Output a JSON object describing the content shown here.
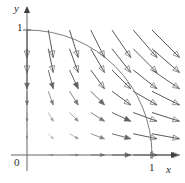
{
  "figure": {
    "kind": "vector-field-plot",
    "background_color": "#ffffff",
    "ink_color": "#4a4a4a",
    "axis_color": "#555555",
    "arc_color": "#666666",
    "label_color": "#2b2b2b"
  },
  "axes": {
    "x_axis_label": "x",
    "y_axis_label": "y",
    "origin_label": "0",
    "x_tick_label": "1",
    "y_tick_label": "1",
    "x_range": [
      0,
      1.15
    ],
    "y_range": [
      0,
      1.15
    ],
    "origin_px": [
      27,
      155
    ],
    "unit_px": 125,
    "x_arrow_tip_px": [
      178,
      155
    ],
    "y_arrow_tip_px": [
      27,
      6
    ]
  },
  "arc": {
    "name": "unit-quarter-circle",
    "radius": 1,
    "center": [
      0,
      0
    ],
    "start": [
      0,
      1
    ],
    "end": [
      1,
      0
    ],
    "quadrant": "first"
  },
  "chart_data": {
    "type": "scatter",
    "title": "",
    "xlabel": "x",
    "ylabel": "y",
    "xlim": [
      0,
      1.15
    ],
    "ylim": [
      0,
      1.15
    ],
    "grid": false,
    "legend": null,
    "field_rule": "arrows point radially outward from origin; length grows with distance from origin",
    "vectors": [
      {
        "x": 0.0,
        "y": 0.0,
        "u": 0.0,
        "v": 0.0
      },
      {
        "x": 0.17,
        "y": 0.0,
        "u": 0.04,
        "v": 0.0
      },
      {
        "x": 0.34,
        "y": 0.0,
        "u": 0.07,
        "v": 0.0
      },
      {
        "x": 0.51,
        "y": 0.0,
        "u": 0.11,
        "v": 0.0
      },
      {
        "x": 0.68,
        "y": 0.0,
        "u": 0.15,
        "v": 0.0
      },
      {
        "x": 0.85,
        "y": 0.0,
        "u": 0.19,
        "v": 0.0
      },
      {
        "x": 1.0,
        "y": 0.0,
        "u": 0.22,
        "v": 0.0
      },
      {
        "x": 0.0,
        "y": 0.17,
        "u": 0.0,
        "v": -0.04
      },
      {
        "x": 0.17,
        "y": 0.17,
        "u": 0.04,
        "v": -0.04
      },
      {
        "x": 0.34,
        "y": 0.17,
        "u": 0.07,
        "v": -0.04
      },
      {
        "x": 0.51,
        "y": 0.17,
        "u": 0.11,
        "v": -0.04
      },
      {
        "x": 0.68,
        "y": 0.17,
        "u": 0.15,
        "v": -0.04
      },
      {
        "x": 0.85,
        "y": 0.17,
        "u": 0.19,
        "v": -0.04
      },
      {
        "x": 1.0,
        "y": 0.17,
        "u": 0.22,
        "v": -0.04
      },
      {
        "x": 0.0,
        "y": 0.34,
        "u": 0.0,
        "v": -0.07
      },
      {
        "x": 0.17,
        "y": 0.34,
        "u": 0.04,
        "v": -0.07
      },
      {
        "x": 0.34,
        "y": 0.34,
        "u": 0.07,
        "v": -0.07
      },
      {
        "x": 0.51,
        "y": 0.34,
        "u": 0.11,
        "v": -0.07
      },
      {
        "x": 0.68,
        "y": 0.34,
        "u": 0.15,
        "v": -0.07
      },
      {
        "x": 0.85,
        "y": 0.34,
        "u": 0.19,
        "v": -0.07
      },
      {
        "x": 1.0,
        "y": 0.34,
        "u": 0.22,
        "v": -0.07
      },
      {
        "x": 0.0,
        "y": 0.51,
        "u": 0.0,
        "v": -0.11
      },
      {
        "x": 0.17,
        "y": 0.51,
        "u": 0.04,
        "v": -0.11
      },
      {
        "x": 0.34,
        "y": 0.51,
        "u": 0.07,
        "v": -0.11
      },
      {
        "x": 0.51,
        "y": 0.51,
        "u": 0.11,
        "v": -0.11
      },
      {
        "x": 0.68,
        "y": 0.51,
        "u": 0.15,
        "v": -0.11
      },
      {
        "x": 0.85,
        "y": 0.51,
        "u": 0.19,
        "v": -0.11
      },
      {
        "x": 1.0,
        "y": 0.51,
        "u": 0.22,
        "v": -0.11
      },
      {
        "x": 0.0,
        "y": 0.68,
        "u": 0.0,
        "v": -0.15
      },
      {
        "x": 0.17,
        "y": 0.68,
        "u": 0.04,
        "v": -0.15
      },
      {
        "x": 0.34,
        "y": 0.68,
        "u": 0.07,
        "v": -0.15
      },
      {
        "x": 0.51,
        "y": 0.68,
        "u": 0.11,
        "v": -0.15
      },
      {
        "x": 0.68,
        "y": 0.68,
        "u": 0.15,
        "v": -0.15
      },
      {
        "x": 0.85,
        "y": 0.68,
        "u": 0.19,
        "v": -0.15
      },
      {
        "x": 1.0,
        "y": 0.68,
        "u": 0.22,
        "v": -0.15
      },
      {
        "x": 0.0,
        "y": 0.85,
        "u": 0.0,
        "v": -0.19
      },
      {
        "x": 0.17,
        "y": 0.85,
        "u": 0.04,
        "v": -0.19
      },
      {
        "x": 0.34,
        "y": 0.85,
        "u": 0.07,
        "v": -0.19
      },
      {
        "x": 0.51,
        "y": 0.85,
        "u": 0.11,
        "v": -0.19
      },
      {
        "x": 0.68,
        "y": 0.85,
        "u": 0.15,
        "v": -0.19
      },
      {
        "x": 0.85,
        "y": 0.85,
        "u": 0.19,
        "v": -0.19
      },
      {
        "x": 1.0,
        "y": 0.85,
        "u": 0.22,
        "v": -0.19
      },
      {
        "x": 0.0,
        "y": 1.0,
        "u": 0.0,
        "v": -0.22
      },
      {
        "x": 0.17,
        "y": 1.0,
        "u": 0.04,
        "v": -0.22
      },
      {
        "x": 0.34,
        "y": 1.0,
        "u": 0.07,
        "v": -0.22
      },
      {
        "x": 0.51,
        "y": 1.0,
        "u": 0.11,
        "v": -0.22
      },
      {
        "x": 0.68,
        "y": 1.0,
        "u": 0.15,
        "v": -0.22
      },
      {
        "x": 0.85,
        "y": 1.0,
        "u": 0.19,
        "v": -0.22
      },
      {
        "x": 1.0,
        "y": 1.0,
        "u": 0.22,
        "v": -0.22
      }
    ]
  }
}
